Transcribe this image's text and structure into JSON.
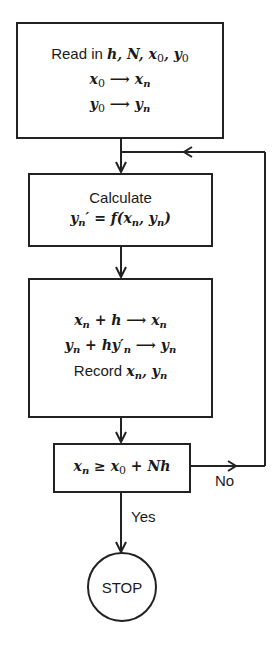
{
  "flowchart": {
    "nodes": [
      {
        "id": "init",
        "type": "process",
        "lines": [
          "Read in h, N, x0, y0",
          "x0 → xn",
          "y0 → yn"
        ],
        "label_read": "Read in"
      },
      {
        "id": "calculate",
        "type": "process",
        "lines": [
          "Calculate",
          "yn′ = f(xn, yn)"
        ],
        "label_calculate": "Calculate"
      },
      {
        "id": "update",
        "type": "process",
        "lines": [
          "xn + h → xn",
          "yn + hy′n → yn",
          "Record xn, yn"
        ],
        "label_record": "Record"
      },
      {
        "id": "decision",
        "type": "decision",
        "lines": [
          "xn ≥ x0 + Nh"
        ]
      },
      {
        "id": "stop",
        "type": "terminal",
        "label": "STOP"
      }
    ],
    "edges": [
      {
        "from": "init",
        "to": "calculate"
      },
      {
        "from": "calculate",
        "to": "update"
      },
      {
        "from": "update",
        "to": "decision"
      },
      {
        "from": "decision",
        "to": "calculate",
        "label": "No"
      },
      {
        "from": "decision",
        "to": "stop",
        "label": "Yes"
      }
    ],
    "labels": {
      "no": "No",
      "yes": "Yes"
    },
    "colors": {
      "stroke": "#222222",
      "background": "#ffffff"
    }
  }
}
